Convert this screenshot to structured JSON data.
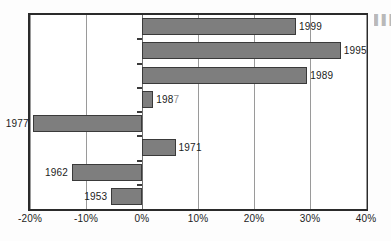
{
  "chart_data": {
    "type": "bar",
    "orientation": "horizontal",
    "title": "",
    "xlabel": "",
    "ylabel": "",
    "xlim": [
      -20,
      40
    ],
    "grid": true,
    "gridlines": [
      -20,
      -10,
      0,
      10,
      20,
      30,
      40
    ],
    "legend": "none",
    "zero_line": 0,
    "units": "percent",
    "categories": [
      "1999",
      "1995",
      "1989",
      "1987",
      "1977",
      "1971",
      "1962",
      "1953"
    ],
    "values": [
      27.5,
      35.5,
      29.5,
      2.0,
      -19.5,
      6.0,
      -12.5,
      -5.5
    ],
    "tick_labels": [
      "-20%",
      "-10%",
      "0%",
      "10%",
      "20%",
      "30%",
      "40%"
    ],
    "tick_values": [
      -20,
      -10,
      0,
      10,
      20,
      30,
      40
    ],
    "bars": [
      {
        "label": "1999",
        "value": 27.5,
        "label_side": "right"
      },
      {
        "label": "1995",
        "value": 35.5,
        "label_side": "right"
      },
      {
        "label": "1989",
        "value": 29.5,
        "label_side": "right"
      },
      {
        "label": "1987",
        "value": 2.0,
        "label_side": "right"
      },
      {
        "label": "1977",
        "value": -19.5,
        "label_side": "left"
      },
      {
        "label": "1971",
        "value": 6.0,
        "label_side": "right"
      },
      {
        "label": "1962",
        "value": -12.5,
        "label_side": "left"
      },
      {
        "label": "1953",
        "value": -5.5,
        "label_side": "left"
      }
    ]
  },
  "colors": {
    "bar_fill": "#7e7e7e",
    "bar_stroke": "#3a3a3a",
    "frame": "#2b2b2b",
    "gridline": "#9a9a9a",
    "text": "#1c1c1c",
    "background": "#ffffff"
  },
  "margin_note": "▌▌▌"
}
